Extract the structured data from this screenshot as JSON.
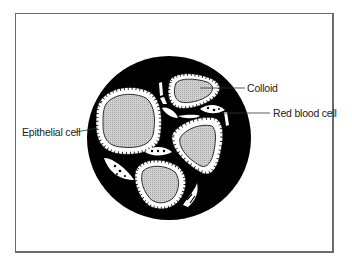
{
  "figure": {
    "type": "histology-diagram"
  },
  "labels": {
    "colloid": "Colloid",
    "red_blood_cell": "Red blood cell",
    "epithelial_cell": "Epithelial cell"
  },
  "colors": {
    "background": "#ffffff",
    "stroma": "#000000",
    "colloid": "#c8c8c8",
    "epithelium": "#ffffff",
    "frame": "#6b6b6b"
  }
}
